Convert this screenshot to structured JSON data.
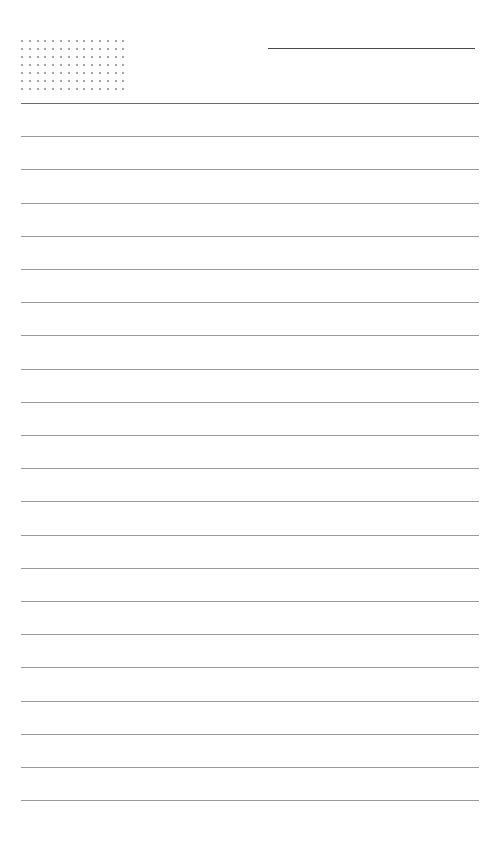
{
  "page": {
    "type": "lined-notepaper",
    "background": "#ffffff",
    "line_color": "#9a9a9a",
    "dot_color": "#8a8a8a"
  },
  "dot_grid": {
    "columns": 14,
    "rows": 7,
    "spacing_x": 7.8,
    "spacing_y": 8
  },
  "header_line": {
    "x": 268,
    "y": 48,
    "width": 207
  },
  "rules": {
    "count": 22,
    "start_y": 103,
    "spacing": 33.2,
    "x": 21,
    "width": 458
  }
}
